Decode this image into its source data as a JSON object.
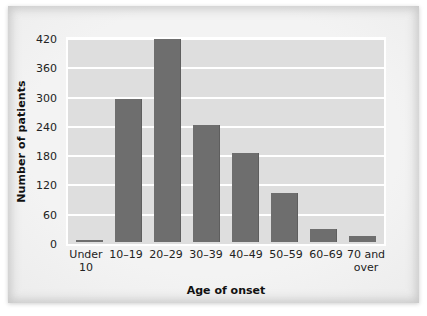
{
  "chart_data": {
    "type": "bar",
    "title": "",
    "xlabel": "Age of onset",
    "ylabel": "Number of patients",
    "categories": [
      "Under 10",
      "10–19",
      "20–29",
      "30–39",
      "40–49",
      "50–59",
      "60–69",
      "70 and over"
    ],
    "category_lines": [
      [
        "Under",
        "10"
      ],
      [
        "10–19",
        ""
      ],
      [
        "20–29",
        ""
      ],
      [
        "30–39",
        ""
      ],
      [
        "40–49",
        ""
      ],
      [
        "50–59",
        ""
      ],
      [
        "60–69",
        ""
      ],
      [
        "70 and",
        "over"
      ]
    ],
    "values": [
      5,
      293,
      415,
      240,
      182,
      100,
      27,
      12
    ],
    "ylim": [
      0,
      420
    ],
    "yticks": [
      0,
      60,
      120,
      180,
      240,
      300,
      360,
      420
    ],
    "ytick_labels": [
      "0",
      "60",
      "120",
      "180",
      "240",
      "300",
      "360",
      "420"
    ],
    "grid": true,
    "legend": "none",
    "colors": {
      "bar": "#6e6e6e",
      "plot_background": "#dedede",
      "gridline": "#ffffff",
      "figure_background": "#efefef",
      "text": "#222222"
    }
  }
}
